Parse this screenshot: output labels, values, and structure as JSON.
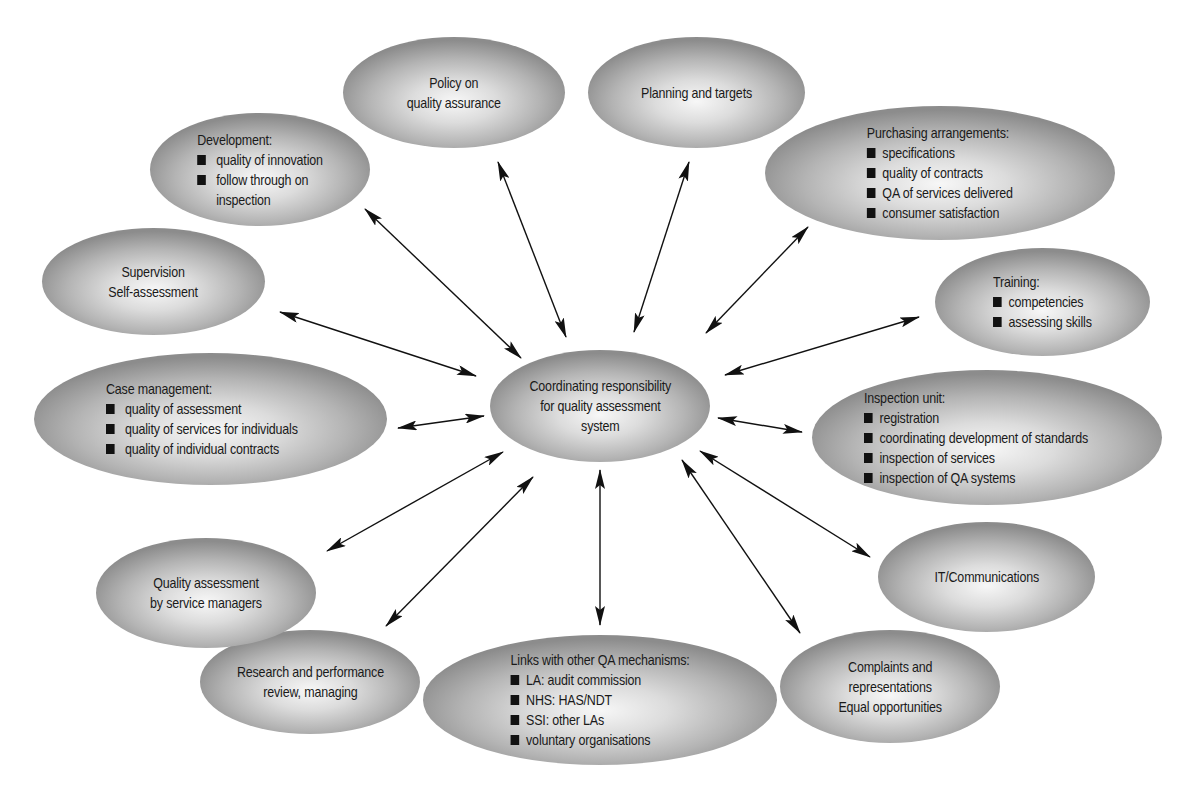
{
  "diagram": {
    "type": "hub-and-spoke",
    "center": {
      "id": "coordinating",
      "text": "Coordinating responsibility for quality assessment system",
      "lines": [
        "Coordinating responsibility",
        "for quality assessment",
        "system"
      ]
    },
    "nodes": [
      {
        "id": "policy",
        "lines": [
          "Policy on",
          "quality assurance"
        ]
      },
      {
        "id": "planning",
        "lines": [
          "Planning and targets"
        ]
      },
      {
        "id": "purchasing",
        "title": "Purchasing arrangements:",
        "items": [
          "specifications",
          "quality of contracts",
          "QA of services delivered",
          "consumer satisfaction"
        ]
      },
      {
        "id": "training",
        "title": "Training:",
        "items": [
          "competencies",
          "assessing skills"
        ]
      },
      {
        "id": "inspection",
        "title": "Inspection unit:",
        "items": [
          "registration",
          "coordinating development of standards",
          "inspection of services",
          "inspection of QA systems"
        ]
      },
      {
        "id": "it",
        "lines": [
          "IT/Communications"
        ]
      },
      {
        "id": "complaints",
        "lines": [
          "Complaints and",
          "representations",
          "Equal opportunities"
        ]
      },
      {
        "id": "links",
        "title": "Links with other QA mechanisms:",
        "items": [
          "LA: audit commission",
          "NHS: HAS/NDT",
          "SSI: other LAs",
          "voluntary organisations"
        ]
      },
      {
        "id": "research",
        "lines": [
          "Research and performance",
          "review, managing"
        ]
      },
      {
        "id": "quality-assessment",
        "lines": [
          "Quality assessment",
          "by service managers"
        ]
      },
      {
        "id": "case-management",
        "title": "Case management:",
        "items": [
          "quality of assessment",
          "quality of services for individuals",
          "quality of individual contracts"
        ]
      },
      {
        "id": "supervision",
        "lines": [
          "Supervision",
          "Self-assessment"
        ]
      },
      {
        "id": "development",
        "title": "Development:",
        "items": [
          "quality of innovation",
          "follow through on inspection"
        ],
        "item_lines": [
          "quality of innovation",
          "follow through on",
          "inspection"
        ]
      }
    ],
    "edges": [
      {
        "from": "coordinating",
        "to": "policy",
        "direction": "both"
      },
      {
        "from": "coordinating",
        "to": "planning",
        "direction": "both"
      },
      {
        "from": "coordinating",
        "to": "purchasing",
        "direction": "both"
      },
      {
        "from": "coordinating",
        "to": "training",
        "direction": "both"
      },
      {
        "from": "coordinating",
        "to": "inspection",
        "direction": "both"
      },
      {
        "from": "coordinating",
        "to": "it",
        "direction": "both"
      },
      {
        "from": "coordinating",
        "to": "complaints",
        "direction": "both"
      },
      {
        "from": "coordinating",
        "to": "links",
        "direction": "both"
      },
      {
        "from": "coordinating",
        "to": "research",
        "direction": "both"
      },
      {
        "from": "coordinating",
        "to": "quality-assessment",
        "direction": "both"
      },
      {
        "from": "coordinating",
        "to": "case-management",
        "direction": "both"
      },
      {
        "from": "coordinating",
        "to": "supervision",
        "direction": "both"
      },
      {
        "from": "coordinating",
        "to": "development",
        "direction": "both"
      }
    ]
  },
  "colors": {
    "ellipse_center": "#f7f7f7",
    "ellipse_edge": "#8c8c8c",
    "text": "#1a1a1a",
    "arrow": "#111111",
    "background": "#ffffff"
  }
}
